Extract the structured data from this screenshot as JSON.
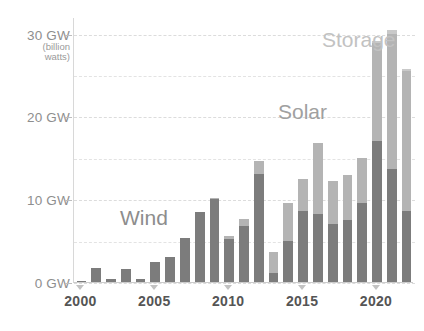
{
  "chart_data": {
    "type": "bar",
    "subtype": "stacked",
    "title": "",
    "xlabel": "",
    "ylabel": "GW (billion watts)",
    "ylim": [
      0,
      32
    ],
    "ytick_values": [
      0,
      10,
      20,
      30
    ],
    "ytick_labels": [
      "0 GW",
      "10 GW",
      "20 GW",
      "30 GW"
    ],
    "y_axis_note_line1": "(billion",
    "y_axis_note_line2": "watts)",
    "grid": true,
    "grid_interval": 5,
    "legend_position": "inline-annotations",
    "x": [
      2000,
      2001,
      2002,
      2003,
      2004,
      2005,
      2006,
      2007,
      2008,
      2009,
      2010,
      2011,
      2012,
      2013,
      2014,
      2015,
      2016,
      2017,
      2018,
      2019,
      2020,
      2021,
      2022
    ],
    "xtick_labels": [
      "2000",
      "2005",
      "2010",
      "2015",
      "2020"
    ],
    "xtick_values": [
      2000,
      2005,
      2010,
      2015,
      2020
    ],
    "series": [
      {
        "name": "Wind",
        "color": "#7c7c7c",
        "values": [
          0.1,
          1.7,
          0.4,
          1.6,
          0.4,
          2.4,
          3.0,
          5.3,
          8.4,
          10.0,
          5.2,
          6.8,
          13.1,
          1.1,
          4.9,
          8.6,
          8.2,
          7.0,
          7.5,
          9.5,
          17.0,
          13.6,
          8.6
        ]
      },
      {
        "name": "Solar",
        "color": "#b4b4b4",
        "values": [
          0.0,
          0.0,
          0.0,
          0.0,
          0.0,
          0.0,
          0.0,
          0.0,
          0.0,
          0.1,
          0.3,
          0.8,
          1.5,
          2.5,
          4.6,
          3.8,
          8.6,
          5.2,
          5.4,
          5.5,
          11.9,
          16.4,
          16.9
        ]
      },
      {
        "name": "Storage",
        "color": "#c9c9c9",
        "values": [
          0.0,
          0.0,
          0.0,
          0.0,
          0.0,
          0.0,
          0.0,
          0.0,
          0.0,
          0.0,
          0.0,
          0.0,
          0.0,
          0.0,
          0.0,
          0.0,
          0.0,
          0.0,
          0.0,
          0.0,
          0.2,
          0.4,
          0.2
        ]
      }
    ],
    "annotations": [
      {
        "text": "Wind",
        "series": "Wind"
      },
      {
        "text": "Solar",
        "series": "Solar"
      },
      {
        "text": "Storage",
        "series": "Storage"
      }
    ]
  },
  "labels": {
    "wind": "Wind",
    "solar": "Solar",
    "storage": "Storage"
  }
}
